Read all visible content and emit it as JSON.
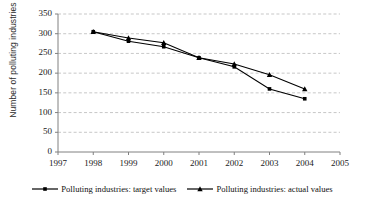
{
  "chart_data": {
    "type": "line",
    "title": "",
    "xlabel": "",
    "ylabel": "Number of polluting industries",
    "x": [
      1998,
      1999,
      2000,
      2001,
      2002,
      2003,
      2004
    ],
    "xlim": [
      1997,
      2005
    ],
    "ylim": [
      0,
      350
    ],
    "xticks": [
      "1997",
      "1998",
      "1999",
      "2000",
      "2001",
      "2002",
      "2003",
      "2004",
      "2005"
    ],
    "yticks": [
      "0",
      "50",
      "100",
      "150",
      "200",
      "250",
      "300",
      "350"
    ],
    "grid": "horizontal-dashed",
    "legend_position": "bottom-center",
    "series": [
      {
        "name": "Polluting industries: target values",
        "marker": "square",
        "color": "#000000",
        "values": [
          305,
          281,
          267,
          239,
          216,
          160,
          135
        ]
      },
      {
        "name": "Polluting industries: actual values",
        "marker": "triangle",
        "color": "#000000",
        "values": [
          305,
          289,
          277,
          239,
          223,
          196,
          160
        ]
      }
    ]
  },
  "legend": {
    "entries": [
      {
        "label": "Polluting industries: target values",
        "marker": "square"
      },
      {
        "label": "Polluting industries: actual values",
        "marker": "triangle"
      }
    ]
  },
  "colors": {
    "line": "#000000",
    "grid": "#b9b9b9",
    "axis": "#808080",
    "text": "#1a1a1a"
  }
}
